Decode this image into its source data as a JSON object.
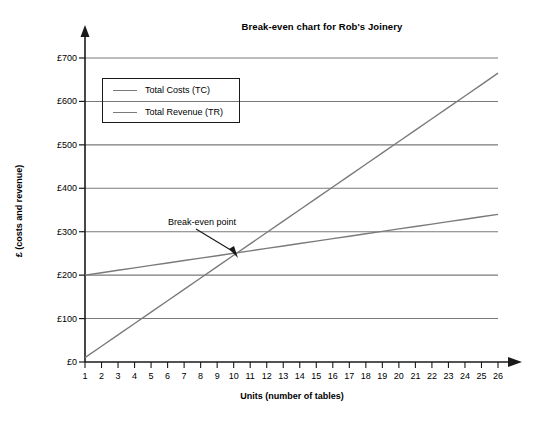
{
  "chart_data": {
    "type": "line",
    "title": "Break-even chart for Rob's Joinery",
    "xlabel": "Units (number of tables)",
    "ylabel": "£ (costs and revenue)",
    "x": [
      1,
      2,
      3,
      4,
      5,
      6,
      7,
      8,
      9,
      10,
      11,
      12,
      13,
      14,
      15,
      16,
      17,
      18,
      19,
      20,
      21,
      22,
      23,
      24,
      25,
      26
    ],
    "xlim": [
      1,
      26
    ],
    "ylim": [
      0,
      700
    ],
    "grid": "horizontal",
    "legend_position": "upper-left-inside",
    "series": [
      {
        "name": "Total Costs (TC)",
        "color": "#7a7a7a",
        "values": [
          200,
          205.6,
          211.2,
          216.8,
          222.4,
          228,
          233.6,
          239.2,
          244.8,
          250.4,
          256,
          261.6,
          267.2,
          272.8,
          278.4,
          284,
          289.6,
          295.2,
          300.8,
          306.4,
          312,
          317.6,
          323.2,
          328.8,
          334.4,
          340
        ]
      },
      {
        "name": "Total Revenue (TR)",
        "color": "#7a7a7a",
        "values": [
          10,
          36.2,
          62.4,
          88.6,
          114.8,
          141,
          167.2,
          193.4,
          219.6,
          245.8,
          272,
          298.2,
          324.4,
          350.6,
          376.8,
          403,
          429.2,
          455.4,
          481.6,
          507.8,
          534,
          560.2,
          586.4,
          612.6,
          638.8,
          665
        ]
      }
    ],
    "ytick_labels": [
      "£700",
      "£600",
      "£500",
      "£400",
      "£300",
      "£200",
      "£100",
      "£0"
    ],
    "ytick_values": [
      700,
      600,
      500,
      400,
      300,
      200,
      100,
      0
    ],
    "xtick_labels": [
      "1",
      "2",
      "3",
      "4",
      "5",
      "6",
      "7",
      "8",
      "9",
      "10",
      "11",
      "12",
      "13",
      "14",
      "15",
      "16",
      "17",
      "18",
      "19",
      "20",
      "21",
      "22",
      "23",
      "24",
      "25",
      "26"
    ],
    "annotations": [
      {
        "text": "Break-even point",
        "points_to_x": 10,
        "points_to_y": 250
      }
    ]
  },
  "legend": {
    "items": [
      {
        "label": "Total Costs (TC)"
      },
      {
        "label": "Total Revenue (TR)"
      }
    ]
  },
  "axis_colors": {
    "axis": "#1a1a1a",
    "gridline": "#7a7a7a",
    "series": "#7a7a7a"
  }
}
